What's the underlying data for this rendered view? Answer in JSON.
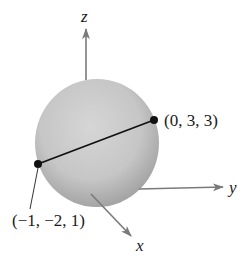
{
  "figure": {
    "axes": {
      "x_label": "x",
      "y_label": "y",
      "z_label": "z",
      "axis_color": "#7a7a7a"
    },
    "sphere": {
      "fill_light": "#d4d4d4",
      "fill_dark": "#a6a6a6"
    },
    "segment": {
      "color": "#111111",
      "endpoints": [
        {
          "label": "(−1, −2, 1)",
          "coords": [
            -1,
            -2,
            1
          ]
        },
        {
          "label": "(0, 3, 3)",
          "coords": [
            0,
            3,
            3
          ]
        }
      ]
    }
  }
}
